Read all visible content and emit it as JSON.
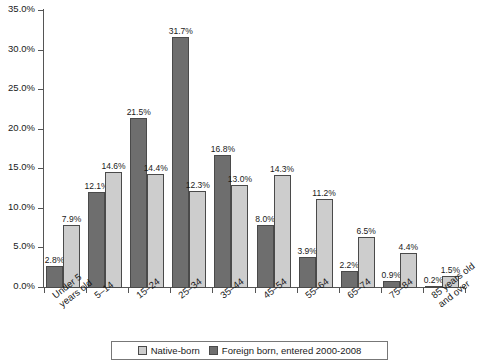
{
  "chart_data": {
    "type": "bar",
    "title": "",
    "subtitle": "",
    "xlabel": "",
    "ylabel": "",
    "ylim": [
      0,
      35
    ],
    "ytick_step": 5,
    "ytick_labels": [
      "0.0%",
      "5.0%",
      "10.0%",
      "15.0%",
      "20.0%",
      "25.0%",
      "30.0%",
      "35.0%"
    ],
    "ytick_values": [
      0,
      5,
      10,
      15,
      20,
      25,
      30,
      35
    ],
    "grid": false,
    "legend_position": "bottom-center",
    "value_labels": true,
    "value_label_format": "0.0%",
    "bar_order": [
      "Foreign born, entered 2000-2008",
      "Native-born"
    ],
    "categories": [
      "Under 5\nyears old",
      "5–14",
      "15–24",
      "25–34",
      "35–44",
      "45–54",
      "55–64",
      "65–74",
      "75–84",
      "85 years old\nand over"
    ],
    "series": [
      {
        "name": "Foreign born, entered 2000-2008",
        "color": "#6e6e6e",
        "values": [
          2.8,
          12.1,
          21.5,
          31.7,
          16.8,
          8.0,
          3.9,
          2.2,
          0.9,
          0.2
        ],
        "labels": [
          "2.8%",
          "12.1%",
          "21.5%",
          "31.7%",
          "16.8%",
          "8.0%",
          "3.9%",
          "2.2%",
          "0.9%",
          "0.2%"
        ]
      },
      {
        "name": "Native-born",
        "color": "#cdcdcd",
        "values": [
          7.9,
          14.6,
          14.4,
          12.3,
          13.0,
          14.3,
          11.2,
          6.5,
          4.4,
          1.5
        ],
        "labels": [
          "7.9%",
          "14.6%",
          "14.4%",
          "12.3%",
          "13.0%",
          "14.3%",
          "11.2%",
          "6.5%",
          "4.4%",
          "1.5%"
        ]
      }
    ]
  },
  "legend": {
    "items": [
      {
        "label": "Native-born",
        "swatch": "light"
      },
      {
        "label": "Foreign born, entered 2000-2008",
        "swatch": "dark"
      }
    ]
  },
  "colors": {
    "native_born": "#cdcdcd",
    "foreign_born": "#6e6e6e",
    "axis": "#555555",
    "text": "#1a1a1a",
    "background": "#ffffff"
  }
}
